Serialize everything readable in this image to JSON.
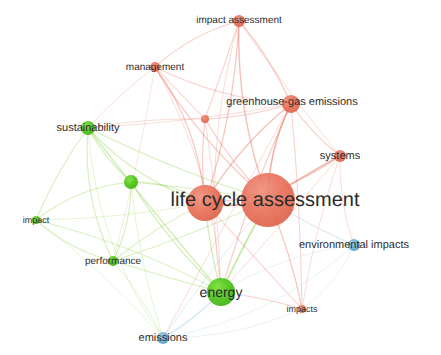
{
  "visualization": {
    "type": "term co-occurrence network map",
    "background_color": "#ffffff",
    "width": 441,
    "height": 355
  },
  "palette": {
    "cluster_red": "#e8705a",
    "cluster_red_dark": "#d95a42",
    "cluster_green": "#4cc417",
    "cluster_green_dark": "#3aa40f",
    "cluster_blue": "#6aaed6",
    "cluster_blue_dark": "#4d93c4",
    "edge_red": "#e8705a",
    "edge_green": "#8fd44a",
    "edge_blue": "#9ecae1",
    "label_color": "#2b2b2b"
  },
  "chart_data": {
    "type": "scatter",
    "title": "",
    "xlabel": "",
    "ylabel": "",
    "xlim": [
      0,
      441
    ],
    "ylim": [
      0,
      355
    ],
    "grid": false,
    "legend": "none",
    "clusters": [
      {
        "id": "red",
        "color": "#e8705a",
        "label": "Cluster 1"
      },
      {
        "id": "green",
        "color": "#4cc417",
        "label": "Cluster 2"
      },
      {
        "id": "blue",
        "color": "#6aaed6",
        "label": "Cluster 3"
      }
    ],
    "nodes": [
      {
        "id": "life-cycle-assessment-main",
        "label": "life cycle assessment",
        "x": 268,
        "y": 200,
        "r": 27,
        "cluster": "red",
        "font_size": 20,
        "label_x": 265,
        "label_y": 200,
        "show_label": true
      },
      {
        "id": "lca-secondary",
        "label": "",
        "x": 205,
        "y": 203,
        "r": 18,
        "cluster": "red",
        "font_size": 0,
        "label_x": 205,
        "label_y": 203,
        "show_label": false
      },
      {
        "id": "greenhouse-gas-emissions",
        "label": "greenhouse-gas emissions",
        "x": 291,
        "y": 104,
        "r": 9,
        "cluster": "red",
        "font_size": 11,
        "label_x": 292,
        "label_y": 102,
        "show_label": true
      },
      {
        "id": "impact-assessment",
        "label": "impact assessment",
        "x": 239,
        "y": 21,
        "r": 6,
        "cluster": "red",
        "font_size": 10,
        "label_x": 239,
        "label_y": 20,
        "show_label": true
      },
      {
        "id": "management",
        "label": "management",
        "x": 155,
        "y": 67,
        "r": 5,
        "cluster": "red",
        "font_size": 10,
        "label_x": 155,
        "label_y": 67,
        "show_label": true
      },
      {
        "id": "systems",
        "label": "systems",
        "x": 340,
        "y": 156,
        "r": 6,
        "cluster": "red",
        "font_size": 11,
        "label_x": 340,
        "label_y": 156,
        "show_label": true
      },
      {
        "id": "impacts",
        "label": "impacts",
        "x": 302,
        "y": 309,
        "r": 4,
        "cluster": "red",
        "font_size": 9,
        "label_x": 302,
        "label_y": 309,
        "show_label": true
      },
      {
        "id": "red-small-unlabeled",
        "label": "",
        "x": 205,
        "y": 119,
        "r": 4,
        "cluster": "red",
        "font_size": 0,
        "label_x": 205,
        "label_y": 119,
        "show_label": false
      },
      {
        "id": "energy",
        "label": "energy",
        "x": 221,
        "y": 292,
        "r": 14,
        "cluster": "green",
        "font_size": 14,
        "label_x": 221,
        "label_y": 292,
        "show_label": true
      },
      {
        "id": "sustainability",
        "label": "sustainability",
        "x": 88,
        "y": 128,
        "r": 7,
        "cluster": "green",
        "font_size": 11,
        "label_x": 88,
        "label_y": 128,
        "show_label": true
      },
      {
        "id": "green-mid-unlabeled",
        "label": "",
        "x": 131,
        "y": 182,
        "r": 7,
        "cluster": "green",
        "font_size": 0,
        "label_x": 131,
        "label_y": 182,
        "show_label": false
      },
      {
        "id": "performance",
        "label": "performance",
        "x": 113,
        "y": 261,
        "r": 5,
        "cluster": "green",
        "font_size": 10,
        "label_x": 113,
        "label_y": 261,
        "show_label": true
      },
      {
        "id": "impact",
        "label": "impact",
        "x": 36,
        "y": 220,
        "r": 4,
        "cluster": "green",
        "font_size": 9,
        "label_x": 36,
        "label_y": 220,
        "show_label": true
      },
      {
        "id": "emissions",
        "label": "emissions",
        "x": 163,
        "y": 338,
        "r": 6,
        "cluster": "blue",
        "font_size": 11,
        "label_x": 163,
        "label_y": 338,
        "show_label": true
      },
      {
        "id": "environmental-impacts",
        "label": "environmental impacts",
        "x": 354,
        "y": 245,
        "r": 6,
        "cluster": "blue",
        "font_size": 11,
        "label_x": 354,
        "label_y": 245,
        "show_label": true
      }
    ],
    "edges": [
      {
        "source": "life-cycle-assessment-main",
        "target": "lca-secondary",
        "cluster": "red",
        "weight": 1.0
      },
      {
        "source": "life-cycle-assessment-main",
        "target": "greenhouse-gas-emissions",
        "cluster": "red",
        "weight": 0.9
      },
      {
        "source": "life-cycle-assessment-main",
        "target": "impact-assessment",
        "cluster": "red",
        "weight": 0.7
      },
      {
        "source": "life-cycle-assessment-main",
        "target": "management",
        "cluster": "red",
        "weight": 0.6
      },
      {
        "source": "life-cycle-assessment-main",
        "target": "systems",
        "cluster": "red",
        "weight": 0.8
      },
      {
        "source": "life-cycle-assessment-main",
        "target": "impacts",
        "cluster": "red",
        "weight": 0.6
      },
      {
        "source": "life-cycle-assessment-main",
        "target": "red-small-unlabeled",
        "cluster": "red",
        "weight": 0.5
      },
      {
        "source": "life-cycle-assessment-main",
        "target": "energy",
        "cluster": "green",
        "weight": 0.9
      },
      {
        "source": "life-cycle-assessment-main",
        "target": "sustainability",
        "cluster": "green",
        "weight": 0.5
      },
      {
        "source": "life-cycle-assessment-main",
        "target": "green-mid-unlabeled",
        "cluster": "green",
        "weight": 0.5
      },
      {
        "source": "life-cycle-assessment-main",
        "target": "performance",
        "cluster": "green",
        "weight": 0.4
      },
      {
        "source": "life-cycle-assessment-main",
        "target": "environmental-impacts",
        "cluster": "blue",
        "weight": 0.5
      },
      {
        "source": "life-cycle-assessment-main",
        "target": "emissions",
        "cluster": "blue",
        "weight": 0.4
      },
      {
        "source": "lca-secondary",
        "target": "greenhouse-gas-emissions",
        "cluster": "red",
        "weight": 0.7
      },
      {
        "source": "lca-secondary",
        "target": "impact-assessment",
        "cluster": "red",
        "weight": 0.6
      },
      {
        "source": "lca-secondary",
        "target": "management",
        "cluster": "red",
        "weight": 0.6
      },
      {
        "source": "lca-secondary",
        "target": "systems",
        "cluster": "red",
        "weight": 0.5
      },
      {
        "source": "lca-secondary",
        "target": "red-small-unlabeled",
        "cluster": "red",
        "weight": 0.5
      },
      {
        "source": "lca-secondary",
        "target": "energy",
        "cluster": "green",
        "weight": 0.6
      },
      {
        "source": "lca-secondary",
        "target": "sustainability",
        "cluster": "green",
        "weight": 0.5
      },
      {
        "source": "lca-secondary",
        "target": "green-mid-unlabeled",
        "cluster": "green",
        "weight": 0.5
      },
      {
        "source": "lca-secondary",
        "target": "performance",
        "cluster": "green",
        "weight": 0.4
      },
      {
        "source": "lca-secondary",
        "target": "impacts",
        "cluster": "red",
        "weight": 0.4
      },
      {
        "source": "lca-secondary",
        "target": "impact",
        "cluster": "green",
        "weight": 0.3
      },
      {
        "source": "greenhouse-gas-emissions",
        "target": "impact-assessment",
        "cluster": "red",
        "weight": 0.5
      },
      {
        "source": "greenhouse-gas-emissions",
        "target": "management",
        "cluster": "red",
        "weight": 0.4
      },
      {
        "source": "greenhouse-gas-emissions",
        "target": "systems",
        "cluster": "red",
        "weight": 0.5
      },
      {
        "source": "greenhouse-gas-emissions",
        "target": "red-small-unlabeled",
        "cluster": "red",
        "weight": 0.4
      },
      {
        "source": "greenhouse-gas-emissions",
        "target": "energy",
        "cluster": "red",
        "weight": 0.5
      },
      {
        "source": "greenhouse-gas-emissions",
        "target": "impacts",
        "cluster": "red",
        "weight": 0.4
      },
      {
        "source": "greenhouse-gas-emissions",
        "target": "emissions",
        "cluster": "red",
        "weight": 0.3
      },
      {
        "source": "greenhouse-gas-emissions",
        "target": "sustainability",
        "cluster": "red",
        "weight": 0.3
      },
      {
        "source": "impact-assessment",
        "target": "management",
        "cluster": "red",
        "weight": 0.4
      },
      {
        "source": "impact-assessment",
        "target": "red-small-unlabeled",
        "cluster": "red",
        "weight": 0.4
      },
      {
        "source": "impact-assessment",
        "target": "systems",
        "cluster": "red",
        "weight": 0.3
      },
      {
        "source": "impact-assessment",
        "target": "energy",
        "cluster": "red",
        "weight": 0.3
      },
      {
        "source": "management",
        "target": "red-small-unlabeled",
        "cluster": "red",
        "weight": 0.4
      },
      {
        "source": "management",
        "target": "sustainability",
        "cluster": "red",
        "weight": 0.3
      },
      {
        "source": "management",
        "target": "energy",
        "cluster": "red",
        "weight": 0.3
      },
      {
        "source": "management",
        "target": "performance",
        "cluster": "red",
        "weight": 0.2
      },
      {
        "source": "systems",
        "target": "impacts",
        "cluster": "red",
        "weight": 0.3
      },
      {
        "source": "systems",
        "target": "environmental-impacts",
        "cluster": "red",
        "weight": 0.3
      },
      {
        "source": "systems",
        "target": "energy",
        "cluster": "red",
        "weight": 0.3
      },
      {
        "source": "red-small-unlabeled",
        "target": "energy",
        "cluster": "red",
        "weight": 0.3
      },
      {
        "source": "red-small-unlabeled",
        "target": "sustainability",
        "cluster": "red",
        "weight": 0.3
      },
      {
        "source": "energy",
        "target": "sustainability",
        "cluster": "green",
        "weight": 0.6
      },
      {
        "source": "energy",
        "target": "green-mid-unlabeled",
        "cluster": "green",
        "weight": 0.6
      },
      {
        "source": "energy",
        "target": "performance",
        "cluster": "green",
        "weight": 0.5
      },
      {
        "source": "energy",
        "target": "impact",
        "cluster": "green",
        "weight": 0.4
      },
      {
        "source": "energy",
        "target": "emissions",
        "cluster": "blue",
        "weight": 0.7
      },
      {
        "source": "energy",
        "target": "impacts",
        "cluster": "red",
        "weight": 0.4
      },
      {
        "source": "energy",
        "target": "environmental-impacts",
        "cluster": "blue",
        "weight": 0.3
      },
      {
        "source": "sustainability",
        "target": "green-mid-unlabeled",
        "cluster": "green",
        "weight": 0.6
      },
      {
        "source": "sustainability",
        "target": "performance",
        "cluster": "green",
        "weight": 0.5
      },
      {
        "source": "sustainability",
        "target": "impact",
        "cluster": "green",
        "weight": 0.5
      },
      {
        "source": "sustainability",
        "target": "emissions",
        "cluster": "green",
        "weight": 0.3
      },
      {
        "source": "green-mid-unlabeled",
        "target": "performance",
        "cluster": "green",
        "weight": 0.5
      },
      {
        "source": "green-mid-unlabeled",
        "target": "impact",
        "cluster": "green",
        "weight": 0.5
      },
      {
        "source": "green-mid-unlabeled",
        "target": "emissions",
        "cluster": "green",
        "weight": 0.3
      },
      {
        "source": "performance",
        "target": "impact",
        "cluster": "green",
        "weight": 0.4
      },
      {
        "source": "performance",
        "target": "emissions",
        "cluster": "green",
        "weight": 0.3
      },
      {
        "source": "impact",
        "target": "emissions",
        "cluster": "green",
        "weight": 0.2
      },
      {
        "source": "emissions",
        "target": "environmental-impacts",
        "cluster": "blue",
        "weight": 0.3
      },
      {
        "source": "emissions",
        "target": "impacts",
        "cluster": "blue",
        "weight": 0.3
      },
      {
        "source": "environmental-impacts",
        "target": "impacts",
        "cluster": "blue",
        "weight": 0.3
      }
    ]
  }
}
